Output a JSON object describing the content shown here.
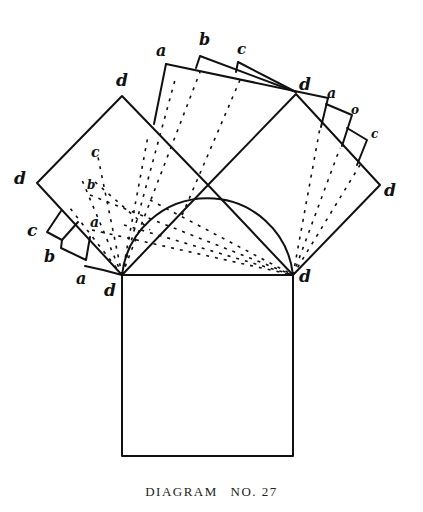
{
  "caption": {
    "title": "DIAGRAM",
    "number": "NO. 27"
  },
  "labels": {
    "left_square_top": "d",
    "left_square_left": "d",
    "top_left_corner": "d",
    "top_right_corner": "d",
    "right_square_top": "d",
    "right_square_right": "d",
    "top_rect_a": "a",
    "top_rect_b": "b",
    "top_rect_c": "c",
    "right_rect_a": "a",
    "right_rect_b": "o",
    "right_rect_c": "c",
    "left_rect_a": "a",
    "left_rect_b": "b",
    "left_rect_c": "c",
    "inner_c": "c",
    "inner_b": "b",
    "inner_a": "a"
  },
  "colors": {
    "ink": "#111111",
    "background": "#ffffff"
  }
}
